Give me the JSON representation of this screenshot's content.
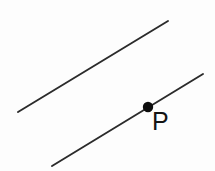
{
  "figure": {
    "kind": "geometry-diagram",
    "width": 215,
    "height": 171,
    "background_color": "#fdfdfd",
    "stroke_color": "#2b2b2b",
    "point_color": "#0d0d0d",
    "label_color": "#141414",
    "stroke_width": 1.9
  },
  "lines": [
    {
      "id": "upper-line",
      "name": "upper-parallel-line",
      "x1": 18,
      "y1": 112,
      "x2": 168,
      "y2": 21,
      "slope": -0.607
    },
    {
      "id": "lower-line",
      "name": "lower-parallel-line",
      "x1": 52,
      "y1": 166,
      "x2": 203,
      "y2": 74,
      "slope": -0.609
    }
  ],
  "points": [
    {
      "id": "point-p",
      "label": "P",
      "cx": 148,
      "cy": 107,
      "r": 5.2,
      "on_line": "lower-line"
    }
  ]
}
